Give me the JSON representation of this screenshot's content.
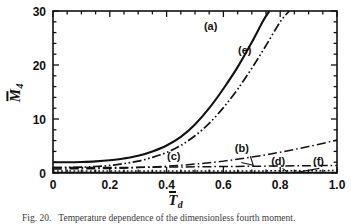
{
  "figure": {
    "caption_number": "Fig. 20.",
    "caption_text": "Temperature dependence of the dimensionless fourth moment.",
    "background_color": "#ffffff",
    "ink_color": "#111111"
  },
  "chart_data": {
    "type": "line",
    "title": "",
    "xlabel": "T̄_d",
    "xlabel_base": "T",
    "xlabel_sub": "d",
    "ylabel": "M̄4",
    "ylabel_base": "M",
    "ylabel_sub": "4",
    "xlim": [
      0,
      1.0
    ],
    "ylim": [
      0,
      30
    ],
    "xticks": [
      0,
      0.2,
      0.4,
      0.6,
      0.8,
      1.0
    ],
    "xtick_labels": [
      "0",
      "0.2",
      "0.4",
      "0.6",
      "0.8",
      "1.0"
    ],
    "yticks": [
      0,
      10,
      20,
      30
    ],
    "ytick_labels": [
      "0",
      "10",
      "20",
      "30"
    ],
    "x_minor_step": 0.05,
    "y_minor_step": 2,
    "grid": false,
    "legend": "inline-labels",
    "series": [
      {
        "name": "(a)",
        "style": "solid",
        "label_x": 0.555,
        "label_y": 26.4,
        "x": [
          0.0,
          0.05,
          0.1,
          0.15,
          0.2,
          0.25,
          0.3,
          0.35,
          0.4,
          0.45,
          0.5,
          0.55,
          0.6,
          0.65,
          0.7,
          0.74,
          0.762
        ],
        "y": [
          2.0,
          2.0,
          2.05,
          2.15,
          2.35,
          2.7,
          3.2,
          4.0,
          5.1,
          6.7,
          9.0,
          12.0,
          15.6,
          19.6,
          24.2,
          28.2,
          30.0
        ]
      },
      {
        "name": "(e)",
        "style": "dash-dot-dot",
        "label_x": 0.675,
        "label_y": 22.0,
        "x": [
          0.0,
          0.05,
          0.1,
          0.15,
          0.2,
          0.25,
          0.3,
          0.35,
          0.4,
          0.45,
          0.5,
          0.55,
          0.6,
          0.65,
          0.7,
          0.75,
          0.8,
          0.832
        ],
        "y": [
          1.0,
          1.02,
          1.08,
          1.2,
          1.4,
          1.75,
          2.2,
          2.9,
          3.8,
          5.1,
          6.9,
          9.2,
          12.1,
          15.5,
          19.4,
          23.6,
          28.0,
          30.0
        ]
      },
      {
        "name": "(b)",
        "style": "dash-dot",
        "label_x": 0.665,
        "label_y": 3.9,
        "leader": [
          [
            0.695,
            3.1
          ],
          [
            0.705,
            1.45
          ],
          [
            0.663,
            1.95
          ]
        ],
        "x": [
          0.0,
          0.1,
          0.2,
          0.3,
          0.4,
          0.5,
          0.6,
          0.7,
          0.8,
          0.9,
          1.0
        ],
        "y": [
          0.75,
          0.78,
          0.85,
          1.0,
          1.25,
          1.65,
          2.2,
          2.95,
          3.85,
          4.9,
          6.1
        ]
      },
      {
        "name": "(c)",
        "style": "dash-dot",
        "label_x": 0.425,
        "label_y": 2.45,
        "x": [
          0.0,
          0.1,
          0.2,
          0.3,
          0.4,
          0.5,
          0.6,
          0.7,
          0.8,
          0.9,
          1.0
        ],
        "y": [
          1.0,
          1.0,
          1.0,
          1.05,
          1.1,
          1.15,
          1.2,
          1.25,
          1.3,
          1.35,
          1.4
        ]
      },
      {
        "name": "(d)",
        "style": "dotted",
        "label_x": 0.793,
        "label_y": 1.55,
        "leader": [
          [
            0.808,
            0.85
          ],
          [
            0.83,
            0.0
          ]
        ],
        "x": [
          0.0,
          0.2,
          0.4,
          0.6,
          0.8,
          1.0
        ],
        "y": [
          0.35,
          0.35,
          0.35,
          0.38,
          0.4,
          0.45
        ]
      },
      {
        "name": "(f)",
        "style": "solid-thin",
        "label_x": 0.935,
        "label_y": 1.55,
        "leader": [
          [
            0.938,
            0.85
          ],
          [
            0.845,
            0.0
          ]
        ],
        "x": [
          0.0,
          0.2,
          0.4,
          0.6,
          0.8,
          1.0
        ],
        "y": [
          0.12,
          0.12,
          0.12,
          0.12,
          0.12,
          0.12
        ]
      }
    ]
  }
}
